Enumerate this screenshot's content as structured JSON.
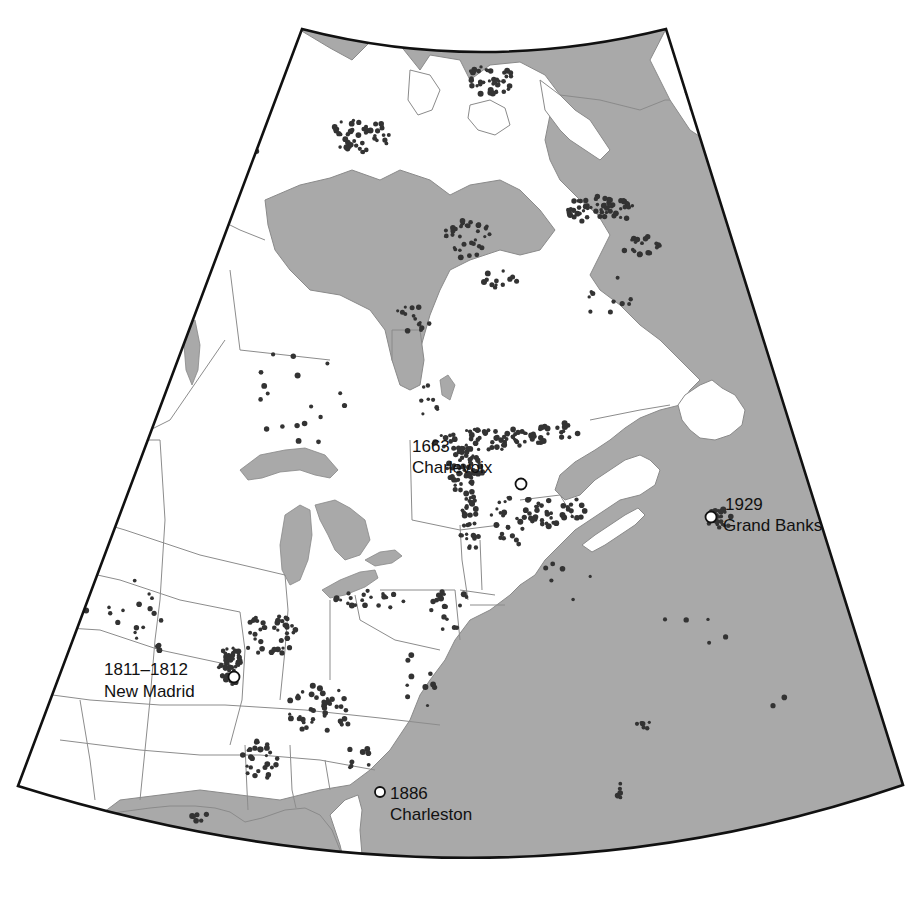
{
  "map": {
    "title": "",
    "colors": {
      "land": "#ffffff",
      "ocean": "#a9a9a9",
      "epicenter": "#333333",
      "historic_marker": "#ffffff",
      "frame": "#111111"
    },
    "historic_earthquakes": [
      {
        "year": "1663",
        "name": "Charlevoix",
        "x": 521,
        "y": 484
      },
      {
        "year": "1929",
        "name": "Grand Banks",
        "x": 711,
        "y": 517
      },
      {
        "year": "1811–1812",
        "name": "New Madrid",
        "x": 234,
        "y": 677
      },
      {
        "year": "1886",
        "name": "Charleston",
        "x": 380,
        "y": 792
      }
    ],
    "legend": {
      "epicenter_symbol": "small dark dot = earthquake epicenter",
      "historic_symbol": "open circle = major historic earthquake"
    }
  }
}
